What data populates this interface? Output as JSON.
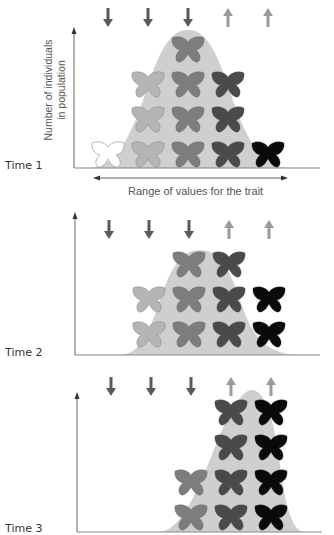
{
  "figure": {
    "y_axis_label_line1": "Number of individuals",
    "y_axis_label_line2": "in population",
    "x_axis_label": "Range of values for the trait",
    "arrow_colors": {
      "down": "#5a5a5a",
      "up": "#9a9a9a"
    },
    "curve_color": "#cfcfcf",
    "butterfly_colors": [
      "#ffffff",
      "#b5b5b5",
      "#7d7d7d",
      "#4a4a4a",
      "#0a0a0a"
    ],
    "arrow_directions": [
      "down",
      "down",
      "down",
      "up",
      "up"
    ]
  },
  "panels": [
    {
      "label": "Time 1",
      "butterfly_counts": [
        1,
        3,
        4,
        3,
        1
      ]
    },
    {
      "label": "Time 2",
      "butterfly_counts": [
        0,
        2,
        3,
        3,
        2
      ]
    },
    {
      "label": "Time 3",
      "butterfly_counts": [
        0,
        0,
        2,
        4,
        4
      ]
    }
  ]
}
